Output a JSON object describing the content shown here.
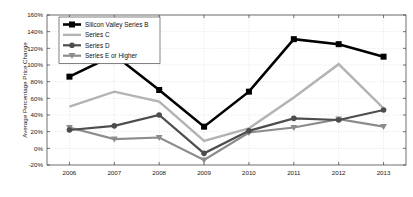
{
  "chart_data": {
    "type": "line",
    "title": "",
    "xlabel": "",
    "ylabel": "Average Percentage Price Change",
    "categories": [
      "2006",
      "2007",
      "2008",
      "2009",
      "2010",
      "2011",
      "2012",
      "2013"
    ],
    "x": [
      2006,
      2007,
      2008,
      2009,
      2010,
      2011,
      2012,
      2013
    ],
    "xlim": [
      2005.5,
      2013.5
    ],
    "ylim": [
      -20,
      160
    ],
    "ytick_labels": [
      "-20%",
      "0%",
      "20%",
      "40%",
      "60%",
      "80%",
      "100%",
      "120%",
      "140%",
      "160%"
    ],
    "ytick_values": [
      -20,
      0,
      20,
      40,
      60,
      80,
      100,
      120,
      140,
      160
    ],
    "grid": true,
    "legend_position": "top-left",
    "series": [
      {
        "name": "Silicon Valley Series B",
        "color": "#000000",
        "marker": "square",
        "width": 2.6,
        "values": [
          86,
          112,
          70,
          26,
          68,
          131,
          125,
          110
        ]
      },
      {
        "name": "Series C",
        "color": "#b3b3b3",
        "marker": "none",
        "width": 2.4,
        "values": [
          50,
          68,
          56,
          9,
          24,
          61,
          101,
          48
        ]
      },
      {
        "name": "Series D",
        "color": "#4d4d4d",
        "marker": "circle",
        "width": 2.2,
        "values": [
          22,
          27,
          40,
          -6,
          21,
          36,
          34,
          46
        ]
      },
      {
        "name": "Series E or Higher",
        "color": "#8c8c8c",
        "marker": "triangle-down",
        "width": 2.2,
        "values": [
          25,
          11,
          13,
          -14,
          19,
          25,
          35,
          26
        ]
      }
    ]
  },
  "legend": {
    "items": [
      {
        "label": "Silicon Valley Series B"
      },
      {
        "label": "Series C"
      },
      {
        "label": "Series D"
      },
      {
        "label": "Series E or Higher"
      }
    ]
  },
  "axes": {
    "y_title": "Average Percentage Price Change"
  }
}
